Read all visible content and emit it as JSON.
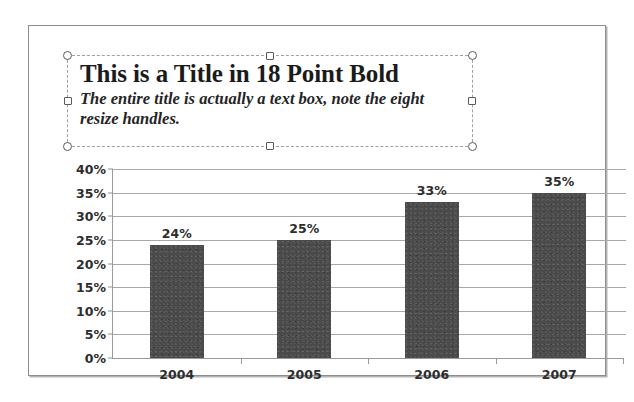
{
  "slide": {
    "background_color": "#ffffff",
    "border_color": "#8d8d8d"
  },
  "title_textbox": {
    "selected": true,
    "heading": "This is a Title in 18 Point Bold",
    "subheading": "The entire title is actually a text box, note the eight resize handles.",
    "border_style": "dashed",
    "border_color": "#a0a0a0",
    "handles": [
      {
        "name": "top-left",
        "shape": "circle"
      },
      {
        "name": "top-middle",
        "shape": "square"
      },
      {
        "name": "top-right",
        "shape": "circle"
      },
      {
        "name": "middle-left",
        "shape": "square"
      },
      {
        "name": "middle-right",
        "shape": "square"
      },
      {
        "name": "bottom-left",
        "shape": "circle"
      },
      {
        "name": "bottom-middle",
        "shape": "square"
      },
      {
        "name": "bottom-right",
        "shape": "circle"
      }
    ]
  },
  "chart_data": {
    "type": "bar",
    "title": "",
    "xlabel": "",
    "ylabel": "",
    "categories": [
      "2004",
      "2005",
      "2006",
      "2007"
    ],
    "values": [
      24,
      25,
      33,
      35
    ],
    "data_labels": [
      "24%",
      "25%",
      "33%",
      "35%"
    ],
    "ylim": [
      0,
      40
    ],
    "ytick_values": [
      0,
      5,
      10,
      15,
      20,
      25,
      30,
      35,
      40
    ],
    "ytick_labels": [
      "0%",
      "5%",
      "10%",
      "15%",
      "20%",
      "25%",
      "30%",
      "35%",
      "40%"
    ],
    "grid": true,
    "legend": false,
    "bar_color": "#4a4a4a",
    "gridline_color": "#a8a8a8",
    "axis_color": "#9a9a9a"
  }
}
